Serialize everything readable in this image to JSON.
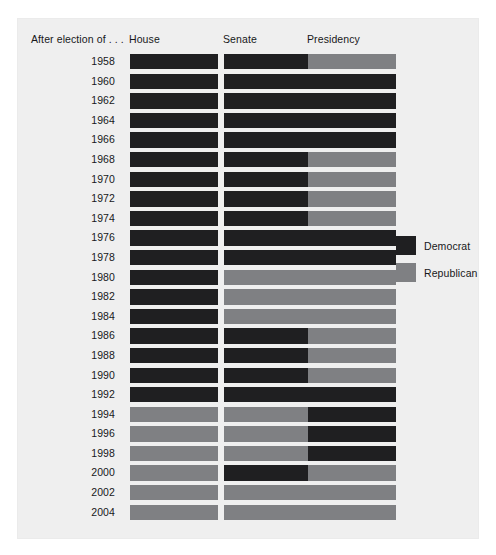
{
  "chart_data": {
    "type": "heatmap",
    "xlabel": "",
    "ylabel": "",
    "row_header": "After election of . . .",
    "categories": [
      "House",
      "Senate",
      "Presidency"
    ],
    "rows": [
      {
        "year": "1958",
        "House": "Democrat",
        "Senate": "Democrat",
        "Presidency": "Republican"
      },
      {
        "year": "1960",
        "House": "Democrat",
        "Senate": "Democrat",
        "Presidency": "Democrat"
      },
      {
        "year": "1962",
        "House": "Democrat",
        "Senate": "Democrat",
        "Presidency": "Democrat"
      },
      {
        "year": "1964",
        "House": "Democrat",
        "Senate": "Democrat",
        "Presidency": "Democrat"
      },
      {
        "year": "1966",
        "House": "Democrat",
        "Senate": "Democrat",
        "Presidency": "Democrat"
      },
      {
        "year": "1968",
        "House": "Democrat",
        "Senate": "Democrat",
        "Presidency": "Republican"
      },
      {
        "year": "1970",
        "House": "Democrat",
        "Senate": "Democrat",
        "Presidency": "Republican"
      },
      {
        "year": "1972",
        "House": "Democrat",
        "Senate": "Democrat",
        "Presidency": "Republican"
      },
      {
        "year": "1974",
        "House": "Democrat",
        "Senate": "Democrat",
        "Presidency": "Republican"
      },
      {
        "year": "1976",
        "House": "Democrat",
        "Senate": "Democrat",
        "Presidency": "Democrat"
      },
      {
        "year": "1978",
        "House": "Democrat",
        "Senate": "Democrat",
        "Presidency": "Democrat"
      },
      {
        "year": "1980",
        "House": "Democrat",
        "Senate": "Republican",
        "Presidency": "Republican"
      },
      {
        "year": "1982",
        "House": "Democrat",
        "Senate": "Republican",
        "Presidency": "Republican"
      },
      {
        "year": "1984",
        "House": "Democrat",
        "Senate": "Republican",
        "Presidency": "Republican"
      },
      {
        "year": "1986",
        "House": "Democrat",
        "Senate": "Democrat",
        "Presidency": "Republican"
      },
      {
        "year": "1988",
        "House": "Democrat",
        "Senate": "Democrat",
        "Presidency": "Republican"
      },
      {
        "year": "1990",
        "House": "Democrat",
        "Senate": "Democrat",
        "Presidency": "Republican"
      },
      {
        "year": "1992",
        "House": "Democrat",
        "Senate": "Democrat",
        "Presidency": "Democrat"
      },
      {
        "year": "1994",
        "House": "Republican",
        "Senate": "Republican",
        "Presidency": "Democrat"
      },
      {
        "year": "1996",
        "House": "Republican",
        "Senate": "Republican",
        "Presidency": "Democrat"
      },
      {
        "year": "1998",
        "House": "Republican",
        "Senate": "Republican",
        "Presidency": "Democrat"
      },
      {
        "year": "2000",
        "House": "Republican",
        "Senate": "Democrat",
        "Presidency": "Republican"
      },
      {
        "year": "2002",
        "House": "Republican",
        "Senate": "Republican",
        "Presidency": "Republican"
      },
      {
        "year": "2004",
        "House": "Republican",
        "Senate": "Republican",
        "Presidency": "Republican"
      }
    ],
    "legend": {
      "position": "right",
      "entries": [
        {
          "label": "Democrat",
          "color": "#1f1f21"
        },
        {
          "label": "Republican",
          "color": "#7f8083"
        }
      ]
    },
    "colors": {
      "democrat": "#1f1f21",
      "republican": "#7f8083",
      "panel_background": "#efefef",
      "page_background": "#ffffff",
      "text": "#17181a"
    },
    "grid": false
  }
}
